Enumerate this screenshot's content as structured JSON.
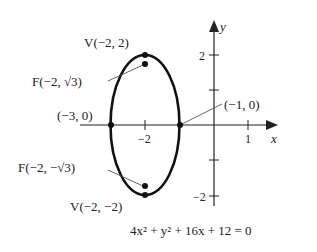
{
  "figure": {
    "equation": "4x² + y² + 16x + 12 = 0",
    "axes": {
      "x_label": "x",
      "y_label": "y",
      "x_ticks": [
        {
          "value": -2,
          "label": "−2"
        },
        {
          "value": 1,
          "label": "1"
        }
      ],
      "y_ticks": [
        {
          "value": 2,
          "label": "2"
        },
        {
          "value": -2,
          "label": "−2"
        }
      ]
    },
    "points": {
      "top_vertex": {
        "label": "V(−2, 2)",
        "x": -2,
        "y": 2
      },
      "top_focus": {
        "label": "F(−2, √3)",
        "x": -2,
        "y": 1.732
      },
      "left_vertex": {
        "label": "(−3, 0)",
        "x": -3,
        "y": 0
      },
      "right_vertex": {
        "label": "(−1, 0)",
        "x": -1,
        "y": 0
      },
      "bottom_focus": {
        "label": "F(−2, −√3)",
        "x": -2,
        "y": -1.732
      },
      "bottom_vertex": {
        "label": "V(−2, −2)",
        "x": -2,
        "y": -2
      }
    },
    "ellipse": {
      "center": [
        -2,
        0
      ],
      "a": 2,
      "b": 1,
      "orientation": "vertical"
    },
    "colors": {
      "curve": "#111111",
      "axis": "#222222",
      "leader": "#555555"
    }
  }
}
